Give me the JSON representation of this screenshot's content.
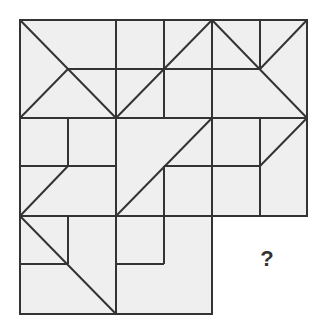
{
  "puzzle": {
    "type": "pattern-completion grid",
    "grid": {
      "columns": 3,
      "rows": 3,
      "missing_block": {
        "row": 3,
        "column": 3
      }
    },
    "question_mark": "?",
    "colors": {
      "tile_fill": "#efefef",
      "line": "#333333",
      "background": "#ffffff"
    }
  }
}
